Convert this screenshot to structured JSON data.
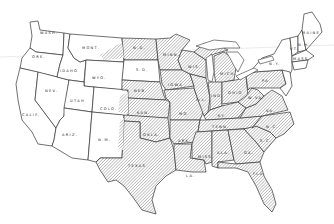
{
  "map": {
    "title": "",
    "legend": {
      "hatched": "Shaded states (central and eastern US)",
      "plain": "Unshaded states (western US and New England/NY)"
    },
    "colors": {
      "outline": "#333333",
      "hatch": "#8a8a8a",
      "background": "#ffffff"
    },
    "states": [
      {
        "id": "wa",
        "label": "WASH.",
        "shaded": false
      },
      {
        "id": "or",
        "label": "ORE.",
        "shaded": false
      },
      {
        "id": "ca",
        "label": "CALIF.",
        "shaded": false
      },
      {
        "id": "id",
        "label": "IDAHO",
        "shaded": false
      },
      {
        "id": "nv",
        "label": "NEV.",
        "shaded": false
      },
      {
        "id": "mt",
        "label": "MONT.",
        "shaded": false
      },
      {
        "id": "wy",
        "label": "WYO.",
        "shaded": false
      },
      {
        "id": "ut",
        "label": "UTAH",
        "shaded": false
      },
      {
        "id": "co",
        "label": "COLO.",
        "shaded": false
      },
      {
        "id": "az",
        "label": "ARIZ.",
        "shaded": false
      },
      {
        "id": "nm",
        "label": "N.M.",
        "shaded": false
      },
      {
        "id": "nd",
        "label": "N.D.",
        "shaded": true
      },
      {
        "id": "sd",
        "label": "S.D.",
        "shaded": false
      },
      {
        "id": "ne",
        "label": "NEB.",
        "shaded": true
      },
      {
        "id": "ks",
        "label": "KAN.",
        "shaded": true
      },
      {
        "id": "ok",
        "label": "OKLA.",
        "shaded": true
      },
      {
        "id": "tx",
        "label": "TEXAS",
        "shaded": true
      },
      {
        "id": "mn",
        "label": "MINN.",
        "shaded": true
      },
      {
        "id": "ia",
        "label": "IOWA",
        "shaded": true
      },
      {
        "id": "mo",
        "label": "MO.",
        "shaded": true
      },
      {
        "id": "ar",
        "label": "ARK.",
        "shaded": true
      },
      {
        "id": "la",
        "label": "LA.",
        "shaded": true
      },
      {
        "id": "wi",
        "label": "WIS.",
        "shaded": true
      },
      {
        "id": "il",
        "label": "ILL.",
        "shaded": true
      },
      {
        "id": "mi",
        "label": "MICH.",
        "shaded": true
      },
      {
        "id": "in",
        "label": "IND.",
        "shaded": true
      },
      {
        "id": "oh",
        "label": "OHIO",
        "shaded": true
      },
      {
        "id": "ky",
        "label": "KY.",
        "shaded": true
      },
      {
        "id": "tn",
        "label": "TENN.",
        "shaded": true
      },
      {
        "id": "ms",
        "label": "MISS.",
        "shaded": true
      },
      {
        "id": "al",
        "label": "ALA.",
        "shaded": true
      },
      {
        "id": "ga",
        "label": "GA.",
        "shaded": true
      },
      {
        "id": "fl",
        "label": "FLA.",
        "shaded": true
      },
      {
        "id": "sc",
        "label": "S.C.",
        "shaded": true
      },
      {
        "id": "nc",
        "label": "N.C.",
        "shaded": true
      },
      {
        "id": "va",
        "label": "VA.",
        "shaded": true
      },
      {
        "id": "wv",
        "label": "W.VA.",
        "shaded": true
      },
      {
        "id": "pa",
        "label": "PA.",
        "shaded": true
      },
      {
        "id": "ny",
        "label": "N.Y.",
        "shaded": false
      },
      {
        "id": "me",
        "label": "MAINE",
        "shaded": false
      },
      {
        "id": "ma",
        "label": "MASS.",
        "shaded": false
      },
      {
        "id": "vt",
        "label": "VT.",
        "shaded": false
      },
      {
        "id": "nh",
        "label": "N.H.",
        "shaded": false
      }
    ]
  }
}
